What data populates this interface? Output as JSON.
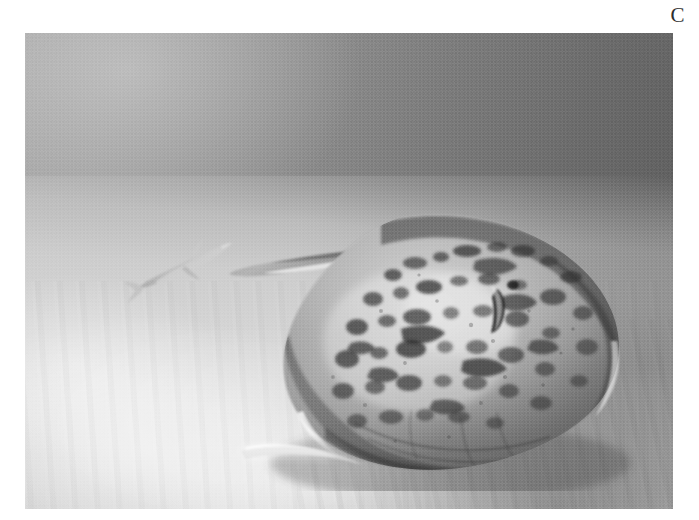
{
  "figure": {
    "panel_label": "C",
    "caption_text": "",
    "photo_type": "black-and-white underwater photograph",
    "background_color": "#ffffff"
  },
  "photo": {
    "frame": {
      "left": 25,
      "top": 33,
      "width": 648,
      "height": 476
    },
    "scene_description": "Underwater scene on a sandy seabed",
    "colors": {
      "water_light": "#a8a8a8",
      "water_dark": "#616161",
      "sand_bright": "#ebebeb",
      "sand_mid": "#d6d6d6",
      "sand_shadow": "#8f8f8f",
      "ray_body_light": "#c9c4ba",
      "ray_body_mid": "#9d9890",
      "ray_body_dark": "#5e5a55",
      "ray_spots": "#2e2c29",
      "fish_body": "#c3c3c3"
    }
  },
  "subjects": {
    "stingray": {
      "name": "stingray",
      "label": "Spotted stingray resting on the seabed",
      "position": {
        "left": 180,
        "top": 168,
        "width": 440,
        "height": 290
      },
      "features": [
        "pectoral-disc",
        "tail",
        "spiracle",
        "eye",
        "dark-spots",
        "wing-edge-highlight",
        "under-body-shadow"
      ]
    },
    "background_fish": {
      "name": "background-fish",
      "label": "Small shark-like fish swimming in the background",
      "position": {
        "left": 96,
        "top": 196,
        "width": 118,
        "height": 78
      },
      "features": [
        "dorsal-fin",
        "pectoral-fin",
        "caudal-fin",
        "snout"
      ]
    }
  },
  "environment": {
    "water_column": "Open water, tonal gradient from light upper-left to dark upper-right",
    "seafloor": "Rippled light sand, brightest at lower-left, shaded toward lower-right",
    "lighting": "Diffuse daylight from upper-left"
  }
}
